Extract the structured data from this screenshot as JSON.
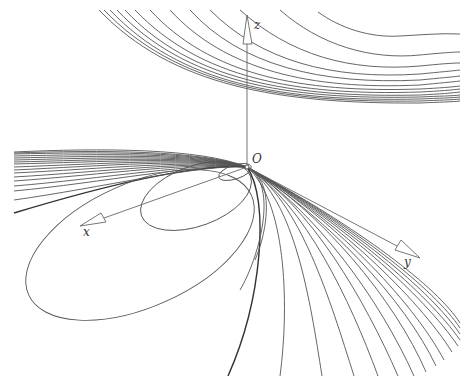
{
  "figure": {
    "type": "3d-curve-family-diagram",
    "axes": {
      "origin_label": "O",
      "x_label": "x",
      "y_label": "y",
      "z_label": "z"
    },
    "curve_groups": [
      {
        "name": "upper-hyperbolic-family",
        "count": 13
      },
      {
        "name": "left-converging-family",
        "count": 20
      },
      {
        "name": "lower-fan-family",
        "count": 18
      },
      {
        "name": "ellipses-through-origin",
        "count": 3
      }
    ],
    "colors": {
      "background": "#ffffff",
      "curve": "#555555",
      "axis": "#666666"
    }
  }
}
